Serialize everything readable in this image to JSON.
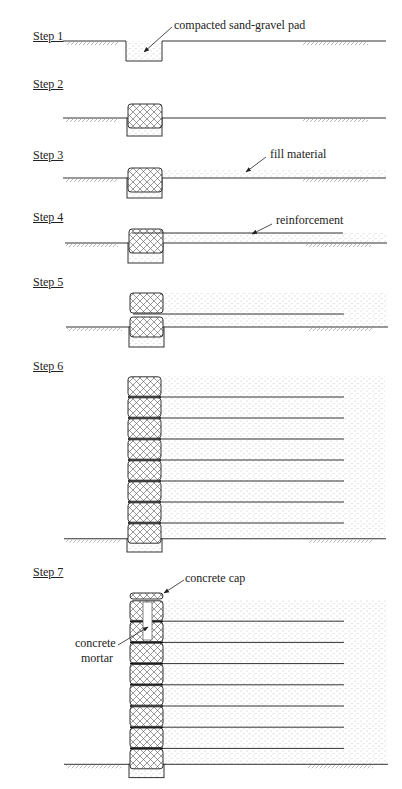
{
  "figure": {
    "colors": {
      "line": "#333333",
      "fill_dots": "#9a9a9a",
      "hatch": "#555555",
      "background": "#ffffff"
    }
  },
  "steps": [
    {
      "label": "Step 1",
      "callout": "compacted sand-gravel pad"
    },
    {
      "label": "Step 2"
    },
    {
      "label": "Step 3",
      "callout": "fill material"
    },
    {
      "label": "Step 4",
      "callout": "reinforcement"
    },
    {
      "label": "Step 5"
    },
    {
      "label": "Step 6",
      "block_count": 8,
      "reinforcement_layers": 7
    },
    {
      "label": "Step 7",
      "callouts": [
        "concrete cap",
        "concrete mortar"
      ],
      "block_count": 8,
      "reinforcement_layers": 7
    }
  ],
  "callouts": {
    "concrete_mortar_line1": "concrete",
    "concrete_mortar_line2": "mortar"
  }
}
